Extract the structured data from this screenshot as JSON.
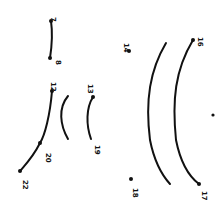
{
  "drawing": {
    "type": "dot-to-dot",
    "orientation": "rotated 90 degrees",
    "ink_color": "#111111",
    "background": "#ffffff",
    "labels": [
      {
        "id": "l7",
        "text": "7",
        "x": 51,
        "y": 17,
        "rot": 90
      },
      {
        "id": "l8",
        "text": "8",
        "x": 56,
        "y": 60,
        "rot": 90
      },
      {
        "id": "l12",
        "text": "12",
        "x": 51,
        "y": 82,
        "rot": 90
      },
      {
        "id": "l13",
        "text": "13",
        "x": 88,
        "y": 84,
        "rot": 90
      },
      {
        "id": "l14",
        "text": "14",
        "x": 124,
        "y": 43,
        "rot": 90
      },
      {
        "id": "l16",
        "text": "16",
        "x": 198,
        "y": 37,
        "rot": 90
      },
      {
        "id": "l17",
        "text": "17",
        "x": 202,
        "y": 191,
        "rot": 90
      },
      {
        "id": "l18",
        "text": "18",
        "x": 133,
        "y": 188,
        "rot": 90
      },
      {
        "id": "l19",
        "text": "19",
        "x": 95,
        "y": 145,
        "rot": 90
      },
      {
        "id": "l20",
        "text": "20",
        "x": 46,
        "y": 153,
        "rot": 90
      },
      {
        "id": "l22",
        "text": "22",
        "x": 23,
        "y": 180,
        "rot": 90
      }
    ]
  }
}
